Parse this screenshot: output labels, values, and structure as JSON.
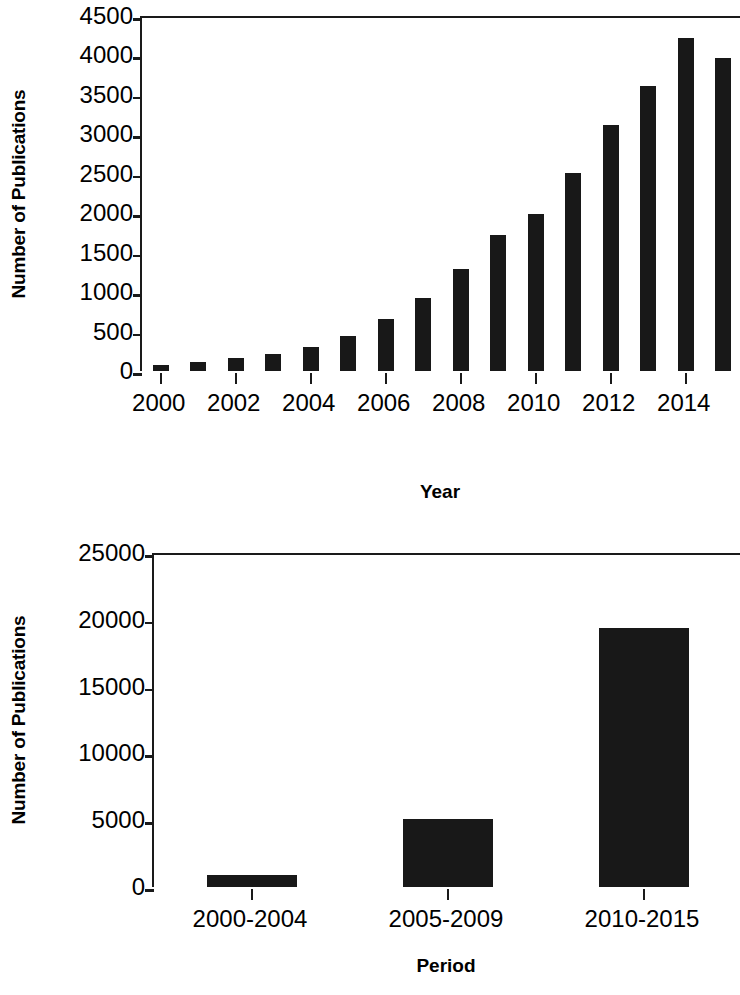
{
  "chart_data": [
    {
      "type": "bar",
      "title": "",
      "xlabel": "Year",
      "ylabel": "Number of Publications",
      "categories": [
        "2000",
        "2001",
        "2002",
        "2003",
        "2004",
        "2005",
        "2006",
        "2007",
        "2008",
        "2009",
        "2010",
        "2011",
        "2012",
        "2013",
        "2014",
        "2015"
      ],
      "values": [
        80,
        120,
        160,
        215,
        310,
        450,
        655,
        930,
        1290,
        1720,
        1990,
        2510,
        3120,
        3610,
        4220,
        3970
      ],
      "xtick_labels": [
        "2000",
        "2002",
        "2004",
        "2006",
        "2008",
        "2010",
        "2012",
        "2014"
      ],
      "ytick_labels": [
        "4500",
        "4000",
        "3500",
        "3000",
        "2500",
        "2000",
        "1500",
        "1000",
        "500",
        "0"
      ],
      "ylim": [
        0,
        4500
      ],
      "ytick_step": 500,
      "grid": false,
      "legend": false,
      "bar_color": "#181818",
      "axis_color": "#1a1a1a"
    },
    {
      "type": "bar",
      "title": "",
      "xlabel": "Period",
      "ylabel": "Number of Publications",
      "categories": [
        "2000-2004",
        "2005-2009",
        "2010-2015"
      ],
      "values": [
        900,
        5100,
        19400
      ],
      "xtick_labels": [
        "2000-2004",
        "2005-2009",
        "2010-2015"
      ],
      "ytick_labels": [
        "25000",
        "20000",
        "15000",
        "10000",
        "5000",
        "0"
      ],
      "ylim": [
        0,
        25000
      ],
      "ytick_step": 5000,
      "grid": false,
      "legend": false,
      "bar_color": "#181818",
      "axis_color": "#1a1a1a"
    }
  ]
}
